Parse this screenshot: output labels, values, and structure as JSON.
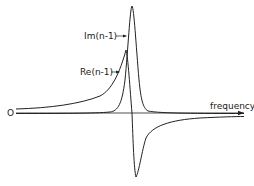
{
  "figure": {
    "origin_label": "O",
    "x_axis_label": "frequency",
    "curves": [
      {
        "name": "imaginary",
        "label": "Im(n-1)",
        "shape": "absorption peak (Lorentzian)"
      },
      {
        "name": "real",
        "label": "Re(n-1)",
        "shape": "dispersion curve"
      }
    ],
    "colors": {
      "line": "#222222",
      "background": "#ffffff"
    }
  }
}
